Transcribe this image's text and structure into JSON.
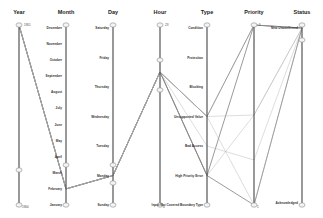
{
  "chart_data": {
    "type": "parallel-coordinates",
    "title": "",
    "axes": [
      {
        "name": "Year",
        "kind": "numeric",
        "range": [
          1900,
          1951
        ],
        "top_label": "1951",
        "bottom_label": "1900",
        "ticks": []
      },
      {
        "name": "Month",
        "kind": "categorical",
        "ticks": [
          "December",
          "November",
          "October",
          "September",
          "August",
          "July",
          "June",
          "May",
          "April",
          "March",
          "February",
          "January"
        ]
      },
      {
        "name": "Day",
        "kind": "categorical",
        "ticks": [
          "Saturday",
          "Friday",
          "Thursday",
          "Wednesday",
          "Tuesday",
          "Monday",
          "Sunday"
        ]
      },
      {
        "name": "Hour",
        "kind": "numeric",
        "range": [
          0,
          23
        ],
        "top_label": "23",
        "bottom_label": "0",
        "ticks": []
      },
      {
        "name": "Type",
        "kind": "categorical",
        "ticks": [
          "Condition",
          "Protection",
          "Blocking",
          "Unsupported Value",
          "Bad Access",
          "High Priority Error",
          "Input Not Covered Boundary Type"
        ]
      },
      {
        "name": "Priority",
        "kind": "numeric",
        "range": [
          1,
          5
        ],
        "top_label": "5",
        "bottom_label": "1",
        "ticks": []
      },
      {
        "name": "Status",
        "kind": "categorical",
        "ticks": [
          "New Unconfirmed",
          "Acknowledged"
        ]
      }
    ],
    "polylines": [
      {
        "style": "dark",
        "values": [
          1951,
          "February",
          "Monday",
          17,
          "Unsupported Value",
          5,
          "New Unconfirmed"
        ]
      },
      {
        "style": "dark",
        "values": [
          1951,
          "February",
          "Monday",
          17,
          "High Priority Error",
          5,
          "New Unconfirmed"
        ]
      },
      {
        "style": "dark",
        "values": [
          1951,
          "February",
          "Monday",
          17,
          "High Priority Error",
          1,
          "New Unconfirmed"
        ]
      },
      {
        "style": "light",
        "values": [
          1951,
          "February",
          "Monday",
          17,
          "Unsupported Value",
          3,
          "New Unconfirmed"
        ]
      },
      {
        "style": "light",
        "values": [
          1951,
          "February",
          "Monday",
          17,
          "Unsupported Value",
          1,
          "New Unconfirmed"
        ]
      },
      {
        "style": "light",
        "values": [
          1951,
          "February",
          "Monday",
          17,
          "High Priority Error",
          3,
          "New Unconfirmed"
        ]
      },
      {
        "style": "light",
        "values": [
          1951,
          "February",
          "Monday",
          17,
          "Bad Access",
          2,
          "New Unconfirmed"
        ]
      },
      {
        "style": "light",
        "values": [
          1951,
          "February",
          "Monday",
          17,
          "Unsupported Value",
          5,
          "New Unconfirmed"
        ]
      }
    ],
    "grid": false,
    "legend": "none"
  }
}
